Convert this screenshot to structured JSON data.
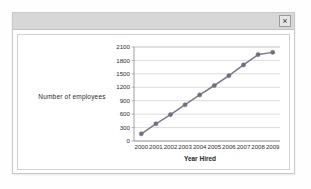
{
  "window": {
    "close_label": "×",
    "close_icon": "close-icon"
  },
  "chart_data": {
    "type": "line",
    "title": "",
    "xlabel": "Year Hired",
    "ylabel": "Number of employees",
    "categories": [
      "2000",
      "2001",
      "2002",
      "2003",
      "2004",
      "2005",
      "2006",
      "2007",
      "2008",
      "2009"
    ],
    "values": [
      160,
      385,
      590,
      810,
      1030,
      1240,
      1460,
      1700,
      1930,
      1980
    ],
    "series": [
      {
        "name": "Number of employees",
        "values": [
          160,
          385,
          590,
          810,
          1030,
          1240,
          1460,
          1700,
          1930,
          1980
        ]
      }
    ],
    "ylim": [
      0,
      2100
    ],
    "yticks": [
      0,
      300,
      600,
      900,
      1200,
      1500,
      1800,
      2100
    ],
    "ytick_labels": [
      "0",
      "300",
      "600",
      "900",
      "1200",
      "1500",
      "1800",
      "2100"
    ],
    "grid": true,
    "grid_axis": "y",
    "legend": false,
    "legend_position": "none",
    "marker": "circle",
    "line_color": "#7b7b8c",
    "marker_color": "#6f6f80",
    "grid_color": "#c4c4c4",
    "axis_color": "#8a8a8a",
    "plot_background": "#ffffff"
  }
}
